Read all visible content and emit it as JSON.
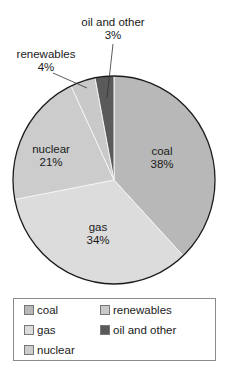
{
  "chart_data": {
    "type": "pie",
    "title": "",
    "start_angle_deg": 0,
    "direction": "clockwise",
    "slices": [
      {
        "label": "coal",
        "value": 38,
        "display": "38%",
        "color": "#b8b8b8"
      },
      {
        "label": "gas",
        "value": 34,
        "display": "34%",
        "color": "#dcdcdc"
      },
      {
        "label": "nuclear",
        "value": 21,
        "display": "21%",
        "color": "#cccccc"
      },
      {
        "label": "renewables",
        "value": 4,
        "display": "4%",
        "color": "#c9c9c9"
      },
      {
        "label": "oil and other",
        "value": 3,
        "display": "3%",
        "color": "#5a5a5a"
      }
    ],
    "legend": {
      "position": "bottom",
      "entries": [
        "coal",
        "gas",
        "nuclear",
        "renewables",
        "oil and other"
      ]
    }
  },
  "labels": {
    "coal": {
      "name": "coal",
      "pct": "38%"
    },
    "gas": {
      "name": "gas",
      "pct": "34%"
    },
    "nuclear": {
      "name": "nuclear",
      "pct": "21%"
    },
    "renewables": {
      "name": "renewables",
      "pct": "4%"
    },
    "oil": {
      "name": "oil and other",
      "pct": "3%"
    }
  },
  "legend": {
    "items": [
      {
        "label": "coal",
        "color": "#b8b8b8"
      },
      {
        "label": "gas",
        "color": "#dcdcdc"
      },
      {
        "label": "nuclear",
        "color": "#cccccc"
      },
      {
        "label": "renewables",
        "color": "#c9c9c9"
      },
      {
        "label": "oil and other",
        "color": "#5a5a5a"
      }
    ]
  }
}
